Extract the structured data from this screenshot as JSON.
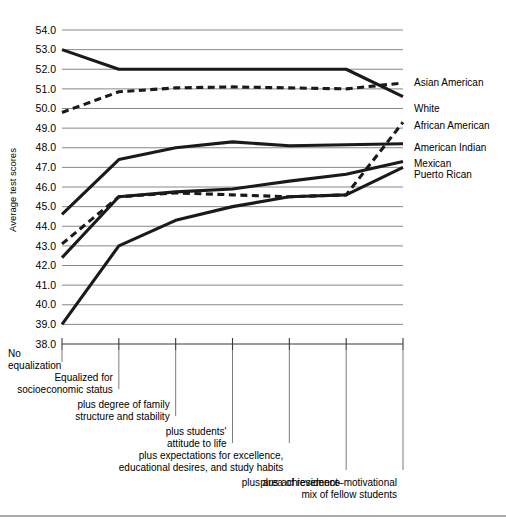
{
  "chart_data": {
    "type": "line",
    "title": "",
    "xlabel": "",
    "ylabel": "Average test scores",
    "ylim": [
      38.0,
      54.0
    ],
    "grid": true,
    "legend_position": "right",
    "y_ticks": [
      "54.0",
      "53.0",
      "52.0",
      "51.0",
      "50.0",
      "49.0",
      "48.0",
      "47.0",
      "46.0",
      "45.0",
      "44.0",
      "43.0",
      "42.0",
      "41.0",
      "40.0",
      "39.0",
      "38.0"
    ],
    "categories": [
      "No equalization",
      "Equalized for socioeconomic status",
      "plus degree of family structure and stability",
      "plus students' attitude to life",
      "plus expectations for excellence, educational desires, and study habits",
      "plus area of residence",
      "plus achievement-motivational mix of fellow students"
    ],
    "category_lines": [
      [
        "No",
        "equalization"
      ],
      [
        "Equalized for",
        "socioeconomic status"
      ],
      [
        "plus degree of family",
        "structure and stability"
      ],
      [
        "plus students'",
        "attitude to life"
      ],
      [
        "plus expectations for excellence,",
        "educational desires, and study habits"
      ],
      [
        "plus area of residence"
      ],
      [
        "plus achievement–motivational",
        "mix of fellow students"
      ]
    ],
    "series": [
      {
        "name": "Asian American",
        "style": "solid",
        "values": [
          53.0,
          52.0,
          52.0,
          52.0,
          52.0,
          52.0,
          50.6
        ]
      },
      {
        "name": "White",
        "style": "dashed",
        "values": [
          49.8,
          50.85,
          51.05,
          51.1,
          51.05,
          51.0,
          51.3
        ]
      },
      {
        "name": "African American",
        "style": "dashed",
        "values": [
          43.1,
          45.5,
          45.7,
          45.6,
          45.5,
          45.6,
          49.3
        ]
      },
      {
        "name": "American Indian",
        "style": "solid",
        "values": [
          44.6,
          47.4,
          48.0,
          48.3,
          48.1,
          48.15,
          48.2
        ]
      },
      {
        "name": "Mexican",
        "style": "solid",
        "values": [
          42.4,
          45.5,
          45.75,
          45.9,
          46.3,
          46.65,
          47.3
        ]
      },
      {
        "name": "Puerto Rican",
        "style": "solid",
        "values": [
          39.0,
          43.0,
          44.3,
          45.0,
          45.5,
          45.6,
          47.0
        ]
      }
    ],
    "legend": [
      {
        "label": "Asian American",
        "y_value": 51.35
      },
      {
        "label": "White",
        "y_value": 50.0
      },
      {
        "label": "African American",
        "y_value": 49.15
      },
      {
        "label": "American Indian",
        "y_value": 48.0
      },
      {
        "label": "Mexican",
        "y_value": 47.2
      },
      {
        "label": "Puerto Rican",
        "y_value": 46.65
      }
    ]
  }
}
